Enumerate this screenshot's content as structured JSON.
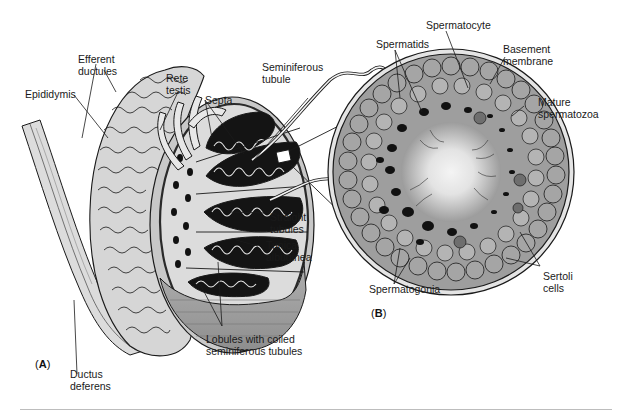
{
  "figure": {
    "panel_a": {
      "tag_open": "(",
      "tag_letter": "A",
      "tag_close": ")",
      "labels": {
        "efferent_ductules": "Efferent\nductules",
        "rete_testis": "Rete\ntestis",
        "seminiferous_tubule": "Seminiferous\ntubule",
        "epididymis": "Epididymis",
        "septa": "Septa",
        "straight_tubules": "Straight\ntubules",
        "tunica_albuginea": "Tunica\nalbuginea",
        "lobules": "Lobules with coiled\nseminiferous tubules",
        "ductus_deferens": "Ductus\ndeferens"
      }
    },
    "panel_b": {
      "tag_open": "(",
      "tag_letter": "B",
      "tag_close": ")",
      "labels": {
        "spermatocyte": "Spermatocyte",
        "spermatids": "Spermatids",
        "basement_membrane": "Basement\nmembrane",
        "mature_spermatozoa": "Mature\nspermatozoa",
        "sertoli_cells": "Sertoli\ncells",
        "spermatogonia": "Spermatogonia"
      }
    },
    "colors": {
      "outline": "#1a1a1a",
      "testis_fill": "#d9d9d9",
      "tunica_fill": "#9a9a9a",
      "lobule_dark": "#111111",
      "cell_fill": "#a8a8a8",
      "cell_light": "#bcbcbc",
      "lumen_center": "#f2f2f2",
      "rule": "#bdbdbd"
    }
  }
}
